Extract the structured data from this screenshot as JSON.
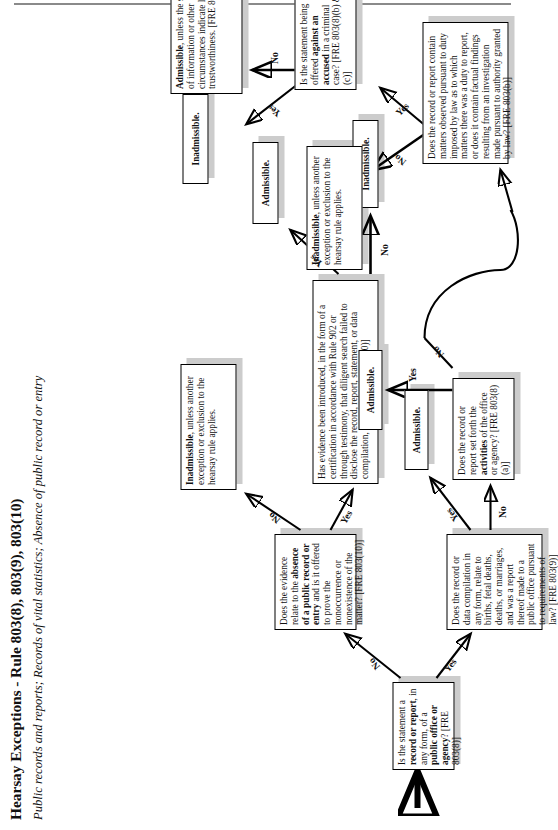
{
  "document": {
    "title": "Hearsay Exceptions - Rule 803(8), 803(9), 803(10)",
    "subtitle": "Public records and reports; Records of vital statistics; Absence of public record or entry"
  },
  "nodes": {
    "start_question": {
      "id": "q1",
      "text_html": "Is the statement a <b>record or report</b>, in any form, of a <b>public office or agency</b>? [FRE 803(8)]",
      "text": "Is the statement a record or report, in any form, of a public office or agency? [FRE 803(8)]"
    },
    "absence_question": {
      "id": "q2",
      "text_html": "Does the evidence relate to the <b>absence of a public record or entry</b> and is it offered to prove the nonoccurrence or nonexistence of the matter? [FRE 803(10)]",
      "text": "Does the evidence relate to the absence of a public record or entry and is it offered to prove the nonoccurrence or nonexistence of the matter? [FRE 803(10)]"
    },
    "vital_statistics_question": {
      "id": "q3",
      "text_html": "Does the record or data compilation in any form, relate to births, fetal deaths, deaths, or marriages, and was a report thereof made to a public office pursuant to requirements of law? [FRE 803(9)]",
      "text": "Does the record or data compilation in any form, relate to births, fetal deaths, deaths, or marriages, and was a report thereof made to a public office pursuant to requirements of law? [FRE 803(9)]"
    },
    "certification_question": {
      "id": "q4",
      "text_html": "Has evidence been introduced, in the form of a certification in accordance with Rule 902 or through testimony, that diligent search failed to disclose the record, report, statement, or data compilation, or entry? [FRE 803(10)]",
      "text": "Has evidence been introduced, in the form of a certification in accordance with Rule 902 or through testimony, that diligent search failed to disclose the record, report, statement, or data compilation, or entry? [FRE 803(10)]"
    },
    "activities_question": {
      "id": "q5",
      "text_html": "Does the record or report set forth the <b>activities</b> of the office or agency? [FRE 803(8)(a)]",
      "text": "Does the record or report set forth the activities of the office or agency? [FRE 803(8)(a)]"
    },
    "duty_question": {
      "id": "q6",
      "text_html": "Does the record or report contain matters observed pursuant to duty imposed by law as to which matters there was a duty to report, or does it contain factual findings resulting from an investigation made pursuant to authority granted by law? [FRE 803(b)]",
      "text": "Does the record or report contain matters observed pursuant to duty imposed by law as to which matters there was a duty to report, or does it contain factual findings resulting from an investigation made pursuant to authority granted by law? [FRE 803(b)]"
    },
    "criminal_question": {
      "id": "q7",
      "text_html": "Is the statement being offered <b>against an accused</b> in a criminal case? [FRE 803(8)(b) &amp; (c)]",
      "text": "Is the statement being offered against an accused in a criminal case? [FRE 803(8)(b) & (c)]"
    },
    "out_admissible_1": {
      "id": "o1",
      "text_html": "Admissible.",
      "text": "Admissible."
    },
    "out_inadmissible_1": {
      "id": "o2",
      "text_html": "Inadmissible.",
      "text": "Inadmissible."
    },
    "out_inadmissible_other_exception": {
      "id": "o3",
      "text_html": "<b>Inadmissible</b>, unless another exception or exclusion to the hearsay rule applies.",
      "text": "Inadmissible, unless another exception or exclusion to the hearsay rule applies."
    },
    "out_admissible_2": {
      "id": "o4",
      "text_html": "Admissible.",
      "text": "Admissible."
    },
    "out_admissible_3": {
      "id": "o5",
      "text_html": "Admissible.",
      "text": "Admissible."
    },
    "out_inadmissible_hearsay_rule": {
      "id": "o6",
      "text_html": "<b>Inadmissible</b>, unless another exception or exclusion to the hearsay rule applies.",
      "text": "Inadmissible, unless another exception or exclusion to the hearsay rule applies."
    },
    "out_inadmissible_2": {
      "id": "o7",
      "text_html": "Inadmissible.",
      "text": "Inadmissible."
    },
    "out_admissible_trustworthiness": {
      "id": "o8",
      "text_html": "<b>Admissible</b>, unless the sources of information or other circumstances indicate lack of trustworthiness. [FRE 803(8)]",
      "text": "Admissible, unless the sources of information or other circumstances indicate lack of trustworthiness. [FRE 803(8)]"
    }
  },
  "edge_labels": {
    "start_no": "No",
    "start_yes": "Yes",
    "absence_no": "No",
    "absence_yes": "Yes",
    "vital_yes": "Yes",
    "vital_no": "No",
    "certification_yes": "Yes",
    "certification_no": "No",
    "activities_yes": "Yes",
    "activities_no": "No",
    "duty_no": "No",
    "duty_yes": "Yes",
    "criminal_yes": "Yes",
    "criminal_no": "No"
  },
  "colors": {
    "page_background": "#ffffff",
    "box_border": "#000000",
    "box_shadow": "#cccccc",
    "text": "#111111",
    "rule": "#8a8a8a"
  },
  "entry_marker": {
    "name": "entry-arrow",
    "glyph": "↑"
  }
}
